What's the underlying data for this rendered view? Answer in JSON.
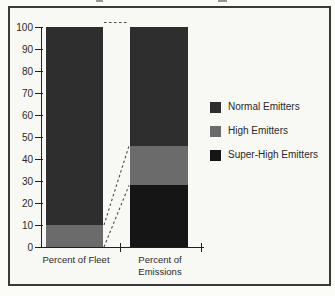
{
  "page": {
    "background": "#fbfbf8",
    "frame_border_color": "#3a3a3a",
    "frame_background": "#f8f8f4",
    "axis_color": "#1f1f1f",
    "text_color": "#2a2a2a"
  },
  "chart_data": {
    "type": "bar",
    "variant": "stacked-percentage-columns",
    "title": "",
    "xlabel": "",
    "ylabel": "",
    "categories": [
      "Percent of Fleet",
      "Percent of Emissions"
    ],
    "series": [
      {
        "name": "Normal Emitters",
        "color": "#2e2e2e",
        "values": [
          90,
          54
        ]
      },
      {
        "name": "High Emitters",
        "color": "#6b6b6b",
        "values": [
          10,
          18
        ]
      },
      {
        "name": "Super-High Emitters",
        "color": "#151515",
        "values": [
          0,
          28
        ]
      }
    ],
    "stack_order_bottom_to_top": [
      "Super-High Emitters",
      "High Emitters",
      "Normal Emitters"
    ],
    "ylim": [
      0,
      100
    ],
    "yticks": [
      0,
      10,
      20,
      30,
      40,
      50,
      60,
      70,
      80,
      90,
      100
    ],
    "grid": false,
    "legend": {
      "position": "right"
    },
    "annotations": {
      "dashed_connectors": [
        {
          "from": {
            "bar": 0,
            "value": 100
          },
          "to": {
            "bar": 1,
            "value": 100
          }
        },
        {
          "from": {
            "bar": 0,
            "value": 10
          },
          "to": {
            "bar": 1,
            "value": 46
          }
        },
        {
          "from": {
            "bar": 0,
            "value": 0
          },
          "to": {
            "bar": 1,
            "value": 28
          }
        }
      ],
      "connector_color": "#4a4a4a"
    }
  }
}
